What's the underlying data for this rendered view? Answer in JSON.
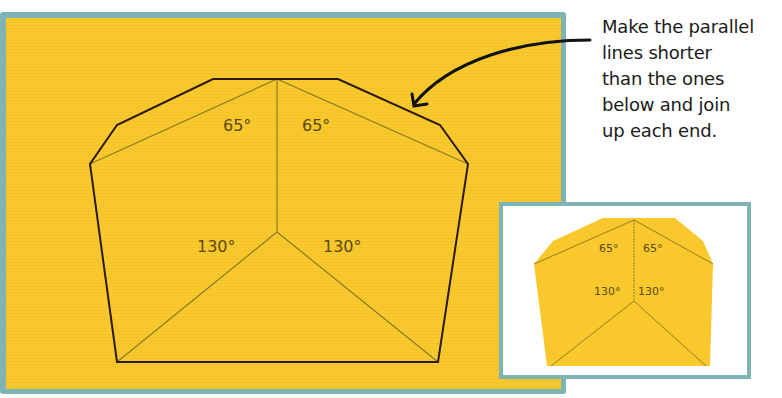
{
  "instruction": {
    "lines": [
      "Make the parallel",
      "lines shorter",
      "than the ones",
      "below and join",
      "up each end."
    ]
  },
  "main_shape": {
    "angles": {
      "top_left": "65°",
      "top_right": "65°",
      "bottom_left": "130°",
      "bottom_right": "130°"
    }
  },
  "inset_shape": {
    "angles": {
      "top_left": "65°",
      "top_right": "65°",
      "bottom_left": "130°",
      "bottom_right": "130°"
    }
  },
  "colors": {
    "paper_yellow": "#f9c82c",
    "frame_teal": "#7fb4b6",
    "outline": "#2a1a10",
    "guide_line": "#8a7a20"
  }
}
